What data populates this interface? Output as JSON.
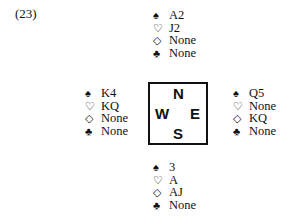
{
  "problem_label": "(23)",
  "suits": {
    "spades": "♠",
    "hearts": "♡",
    "diamonds": "◇",
    "clubs": "♣"
  },
  "compass": {
    "north": "N",
    "west": "W",
    "east": "E",
    "south": "S"
  },
  "hands": {
    "north": {
      "spades": "A2",
      "hearts": "J2",
      "diamonds": "None",
      "clubs": "None"
    },
    "west": {
      "spades": "K4",
      "hearts": "KQ",
      "diamonds": "None",
      "clubs": "None"
    },
    "east": {
      "spades": "Q5",
      "hearts": "None",
      "diamonds": "KQ",
      "clubs": "None"
    },
    "south": {
      "spades": "3",
      "hearts": "A",
      "diamonds": "AJ",
      "clubs": "None"
    }
  }
}
